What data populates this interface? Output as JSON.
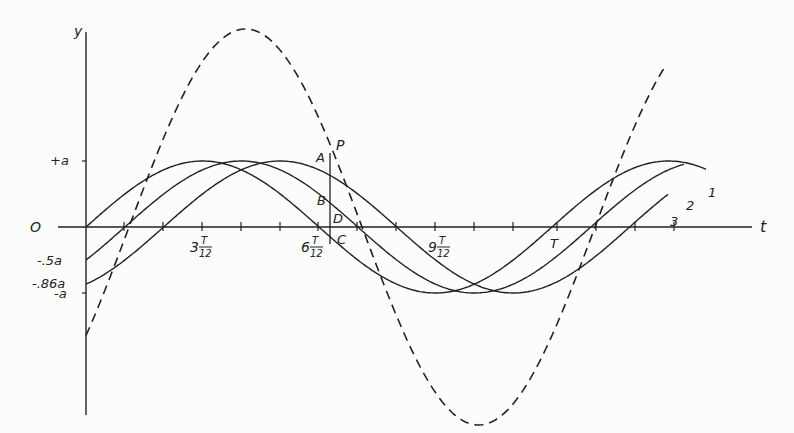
{
  "figure": {
    "axes": {
      "y_label": "y",
      "x_label": "t",
      "origin_label": "O",
      "y_ticks": [
        {
          "label": "+a",
          "value": 1
        },
        {
          "label": "-.5a",
          "value": -0.5
        },
        {
          "label": "-.86a",
          "value": -0.86
        },
        {
          "label": "-a",
          "value": -1
        }
      ],
      "x_ticks": [
        {
          "label_whole": "3",
          "label_num": "T",
          "label_den": "12",
          "frac": 0.25
        },
        {
          "label_whole": "6",
          "label_num": "T",
          "label_den": "12",
          "frac": 0.5
        },
        {
          "label_whole": "9",
          "label_num": "T",
          "label_den": "12",
          "frac": 0.75
        },
        {
          "label_whole": "",
          "label_num": "T",
          "label_den": "",
          "frac": 1.0
        }
      ]
    },
    "curves": [
      {
        "label": "1",
        "phase_deg": 0,
        "style": "solid"
      },
      {
        "label": "2",
        "phase_deg": -30,
        "style": "solid"
      },
      {
        "label": "3",
        "phase_deg": -60,
        "style": "solid"
      },
      {
        "label": "",
        "phase_deg": -30,
        "style": "dashed",
        "amplitude_factor": 2.9
      }
    ],
    "points": [
      {
        "label": "P"
      },
      {
        "label": "A"
      },
      {
        "label": "B"
      },
      {
        "label": "C"
      },
      {
        "label": "D"
      }
    ]
  }
}
